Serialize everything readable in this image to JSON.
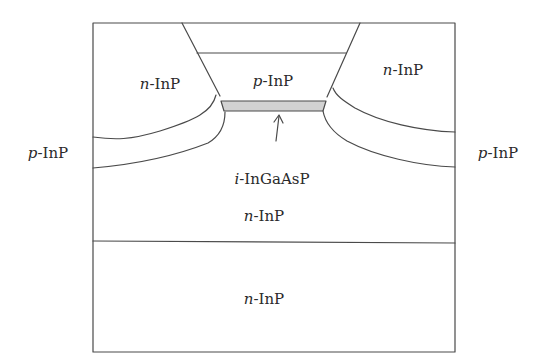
{
  "diagram": {
    "type": "semiconductor laser cross-section (buried heterostructure)",
    "colors": {
      "line": "#4a4a4a",
      "active_fill": "#d2d2d2",
      "background": "#ffffff",
      "text": "#2a2a2a"
    },
    "regions": [
      {
        "id": "upper-left-blocking",
        "prefix": "n",
        "material": "-InP",
        "x": 160,
        "y": 84
      },
      {
        "id": "upper-right-blocking",
        "prefix": "n",
        "material": "-InP",
        "x": 403,
        "y": 70
      },
      {
        "id": "mesa-cladding",
        "prefix": "p",
        "material": "-InP",
        "x": 273,
        "y": 81
      },
      {
        "id": "left-p-layer",
        "prefix": "p",
        "material": "-InP",
        "x": 48,
        "y": 153
      },
      {
        "id": "right-p-layer",
        "prefix": "p",
        "material": "-InP",
        "x": 498,
        "y": 153
      },
      {
        "id": "active-layer-label",
        "prefix": "i",
        "material": "-InGaAsP",
        "x": 272,
        "y": 179
      },
      {
        "id": "lower-cladding",
        "prefix": "n",
        "material": "-InP",
        "x": 264,
        "y": 216
      },
      {
        "id": "substrate",
        "prefix": "n",
        "material": "-InP",
        "x": 264,
        "y": 299
      }
    ],
    "arrow": {
      "from": [
        276,
        141
      ],
      "to": [
        276,
        116
      ],
      "points_to": "i-InGaAsP active layer"
    }
  }
}
